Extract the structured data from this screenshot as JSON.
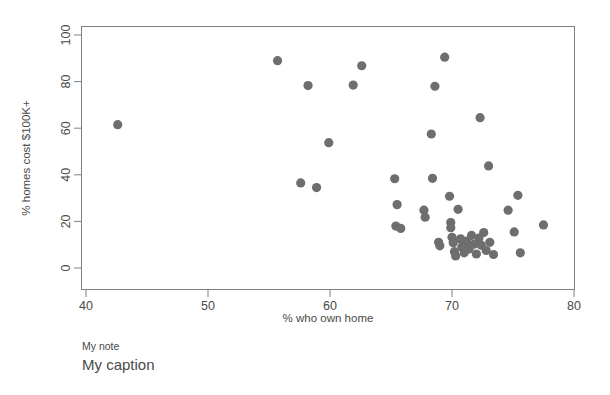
{
  "chart_data": {
    "type": "scatter",
    "title": "",
    "xlabel": "% who own home",
    "ylabel": "% homes cost $100K+",
    "xlim": [
      40,
      80
    ],
    "ylim": [
      0,
      100
    ],
    "xticks": [
      40,
      50,
      60,
      70,
      80
    ],
    "yticks": [
      0,
      20,
      40,
      60,
      80,
      100
    ],
    "xtick_labels": [
      "40",
      "50",
      "60",
      "70",
      "80"
    ],
    "ytick_labels": [
      "0",
      "20",
      "40",
      "60",
      "80",
      "100"
    ],
    "grid": false,
    "legend": null,
    "marker": {
      "shape": "circle",
      "color": "#6e6e6e",
      "size": 8
    },
    "points": [
      {
        "x": 42.6,
        "y": 61.5
      },
      {
        "x": 55.7,
        "y": 89.0
      },
      {
        "x": 58.2,
        "y": 78.3
      },
      {
        "x": 57.6,
        "y": 36.5
      },
      {
        "x": 58.9,
        "y": 34.5
      },
      {
        "x": 59.9,
        "y": 53.8
      },
      {
        "x": 61.9,
        "y": 78.5
      },
      {
        "x": 62.6,
        "y": 86.8
      },
      {
        "x": 65.3,
        "y": 38.3
      },
      {
        "x": 65.5,
        "y": 27.2
      },
      {
        "x": 65.4,
        "y": 18.0
      },
      {
        "x": 65.8,
        "y": 17.0
      },
      {
        "x": 67.7,
        "y": 24.8
      },
      {
        "x": 67.8,
        "y": 21.8
      },
      {
        "x": 68.3,
        "y": 57.5
      },
      {
        "x": 68.6,
        "y": 78.0
      },
      {
        "x": 68.4,
        "y": 38.5
      },
      {
        "x": 68.9,
        "y": 11.0
      },
      {
        "x": 69.0,
        "y": 9.5
      },
      {
        "x": 69.4,
        "y": 90.5
      },
      {
        "x": 69.8,
        "y": 30.8
      },
      {
        "x": 69.9,
        "y": 19.5
      },
      {
        "x": 69.9,
        "y": 17.3
      },
      {
        "x": 70.0,
        "y": 13.2
      },
      {
        "x": 70.1,
        "y": 10.8
      },
      {
        "x": 70.2,
        "y": 7.0
      },
      {
        "x": 70.3,
        "y": 5.2
      },
      {
        "x": 70.5,
        "y": 25.2
      },
      {
        "x": 70.7,
        "y": 12.5
      },
      {
        "x": 70.8,
        "y": 9.0
      },
      {
        "x": 71.0,
        "y": 6.5
      },
      {
        "x": 71.2,
        "y": 11.5
      },
      {
        "x": 71.4,
        "y": 8.2
      },
      {
        "x": 71.6,
        "y": 14.0
      },
      {
        "x": 71.8,
        "y": 10.2
      },
      {
        "x": 72.0,
        "y": 6.0
      },
      {
        "x": 72.2,
        "y": 12.8
      },
      {
        "x": 72.3,
        "y": 64.5
      },
      {
        "x": 72.4,
        "y": 9.8
      },
      {
        "x": 72.6,
        "y": 15.2
      },
      {
        "x": 72.8,
        "y": 7.5
      },
      {
        "x": 73.0,
        "y": 43.8
      },
      {
        "x": 73.1,
        "y": 11.0
      },
      {
        "x": 73.4,
        "y": 5.8
      },
      {
        "x": 74.6,
        "y": 24.8
      },
      {
        "x": 75.1,
        "y": 15.5
      },
      {
        "x": 75.4,
        "y": 31.2
      },
      {
        "x": 75.6,
        "y": 6.5
      },
      {
        "x": 77.5,
        "y": 18.5
      }
    ]
  },
  "annotations": {
    "note": "My note",
    "caption": "My caption"
  }
}
